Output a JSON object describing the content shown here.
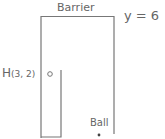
{
  "diagram": {
    "barrier_label": "Barrier",
    "barrier_equation": "y = 6",
    "hole": {
      "letter": "H",
      "coords": "(3, 2)"
    },
    "ball_label": "Ball",
    "colors": {
      "line": "#777777",
      "text": "#666666",
      "ball": "#444444"
    }
  }
}
